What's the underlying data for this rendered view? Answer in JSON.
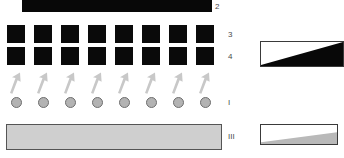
{
  "figure": {
    "background_color": "#ffffff",
    "width": 344,
    "height": 158
  },
  "layers": {
    "layer2": {
      "label": "2",
      "kind": "solid-bar",
      "color": "#080808"
    },
    "layer3": {
      "label": "3",
      "kind": "square-array",
      "count": 8,
      "color": "#0a0a0a"
    },
    "layer4": {
      "label": "4",
      "kind": "square-array",
      "count": 8,
      "color": "#0a0a0a"
    },
    "layerI": {
      "label": "I",
      "kind": "arrow-and-circle-array",
      "count": 8,
      "arrow_color": "#c8c8c8",
      "circle_fill": "#b3b3b3",
      "circle_stroke": "#6e6e6e"
    },
    "layerIII": {
      "label": "III",
      "kind": "slab",
      "fill": "#cfcfcf",
      "stroke": "#555555"
    }
  },
  "wedges": {
    "dark": {
      "fill": "#080808",
      "stroke": "#3a3a3a",
      "orientation": "thin-left-thick-right"
    },
    "light": {
      "fill": "#b9b9b9",
      "stroke": "#3a3a3a",
      "orientation": "thin-left-thick-right"
    }
  },
  "caption": {
    "text": "",
    "color": "#9a9a9a"
  },
  "icons": {
    "arrow_up": "arrow-up-icon",
    "circle": "circle-icon"
  }
}
